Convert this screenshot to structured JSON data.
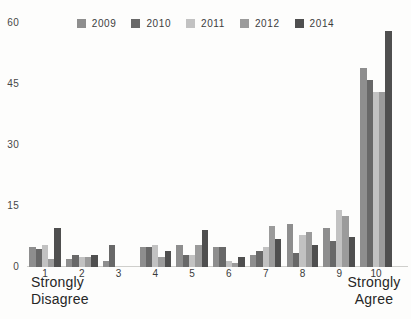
{
  "chart_data": {
    "type": "bar",
    "title": "",
    "xlabel": "",
    "ylabel": "",
    "categories": [
      "1",
      "2",
      "3",
      "4",
      "5",
      "6",
      "7",
      "8",
      "9",
      "10"
    ],
    "x_sublabels": {
      "left": "Strongly\nDisagree",
      "right": "Strongly\nAgree"
    },
    "series": [
      {
        "name": "2009",
        "color": "#8e8e8e",
        "values": [
          5,
          2,
          1.5,
          5,
          5.5,
          5,
          3,
          10.5,
          9.5,
          49
        ]
      },
      {
        "name": "2010",
        "color": "#686868",
        "values": [
          4.5,
          3,
          5.5,
          5,
          3,
          5,
          4,
          3.5,
          6.5,
          46
        ]
      },
      {
        "name": "2011",
        "color": "#c2c2c2",
        "values": [
          5.5,
          2.5,
          0,
          5.5,
          3,
          1.5,
          5,
          8,
          14,
          43
        ]
      },
      {
        "name": "2012",
        "color": "#9b9b9b",
        "values": [
          2,
          2.5,
          0,
          2.5,
          5.5,
          1,
          10,
          8.5,
          12.5,
          43
        ]
      },
      {
        "name": "2014",
        "color": "#4f4f4f",
        "values": [
          9.5,
          3,
          0,
          4,
          9,
          2.5,
          7,
          5.5,
          7.5,
          58
        ]
      }
    ],
    "ylim": [
      0,
      60
    ],
    "yticks": [
      0,
      15,
      30,
      45,
      60
    ],
    "grid": false,
    "legend_position": "top",
    "background": "#fdfdfc"
  }
}
